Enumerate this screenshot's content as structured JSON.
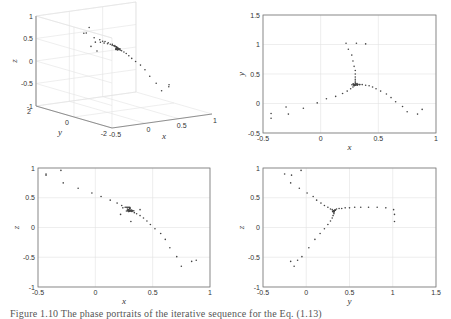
{
  "chart_data": [
    {
      "id": "view3d",
      "type": "scatter",
      "projection": "3d",
      "title": "",
      "xlabel": "x",
      "ylabel": "y",
      "zlabel": "z",
      "xlim": [
        -0.5,
        1
      ],
      "ylim": [
        -2,
        2
      ],
      "zlim": [
        -1,
        1
      ],
      "xticks": [
        "-0.5",
        "0",
        "0.5",
        "1"
      ],
      "yticks": [
        "-2",
        "0",
        "2"
      ],
      "zticks": [
        "-1",
        "-0.5",
        "0",
        "0.5",
        "1"
      ],
      "grid": true,
      "points_ref": "points"
    },
    {
      "id": "xy",
      "type": "scatter",
      "title": "",
      "xlabel": "x",
      "ylabel": "y",
      "xlim": [
        -0.5,
        1
      ],
      "ylim": [
        -0.5,
        1.5
      ],
      "xticks": [
        "-0.5",
        "0",
        "0.5",
        "1"
      ],
      "yticks": [
        "-0.5",
        "0",
        "0.5",
        "1",
        "1.5"
      ],
      "grid": true,
      "axes": [
        "x",
        "y"
      ]
    },
    {
      "id": "xz",
      "type": "scatter",
      "title": "",
      "xlabel": "x",
      "ylabel": "z",
      "xlim": [
        -0.5,
        1
      ],
      "ylim": [
        -1,
        1
      ],
      "xticks": [
        "-0.5",
        "0",
        "0.5",
        "1"
      ],
      "yticks": [
        "-1",
        "-0.5",
        "0",
        "0.5",
        "1"
      ],
      "grid": true,
      "axes": [
        "x",
        "z"
      ]
    },
    {
      "id": "yz",
      "type": "scatter",
      "title": "",
      "xlabel": "y",
      "ylabel": "z",
      "xlim": [
        -0.5,
        1.5
      ],
      "ylim": [
        -1,
        1
      ],
      "xticks": [
        "-0.5",
        "0",
        "0.5",
        "1",
        "1.5"
      ],
      "yticks": [
        "-1",
        "-0.5",
        "0",
        "0.5",
        "1"
      ],
      "grid": true,
      "axes": [
        "y",
        "z"
      ]
    }
  ],
  "points": {
    "fixed_point": [
      0.3,
      0.32,
      0.28
    ],
    "arm_a": [
      [
        -0.43,
        -0.25,
        0.9
      ],
      [
        -0.43,
        -0.17,
        0.88
      ],
      [
        -0.3,
        -0.06,
        0.96
      ],
      [
        -0.28,
        -0.18,
        0.75
      ],
      [
        -0.15,
        -0.08,
        0.66
      ],
      [
        -0.03,
        0.01,
        0.58
      ],
      [
        0.05,
        0.08,
        0.52
      ],
      [
        0.13,
        0.12,
        0.46
      ],
      [
        0.19,
        0.17,
        0.41
      ],
      [
        0.23,
        0.21,
        0.37
      ],
      [
        0.26,
        0.25,
        0.34
      ],
      [
        0.28,
        0.28,
        0.31
      ],
      [
        0.29,
        0.3,
        0.3
      ]
    ],
    "arm_b": [
      [
        0.22,
        1.02,
        0.22
      ],
      [
        0.31,
        1.02,
        0.1
      ],
      [
        0.39,
        1.01,
        0.3
      ],
      [
        0.24,
        0.92,
        0.33
      ],
      [
        0.27,
        0.82,
        0.34
      ],
      [
        0.28,
        0.72,
        0.34
      ],
      [
        0.29,
        0.63,
        0.34
      ],
      [
        0.3,
        0.56,
        0.34
      ],
      [
        0.3,
        0.5,
        0.33
      ],
      [
        0.3,
        0.45,
        0.33
      ],
      [
        0.3,
        0.41,
        0.32
      ],
      [
        0.3,
        0.38,
        0.32
      ],
      [
        0.3,
        0.35,
        0.31
      ]
    ],
    "arm_c": [
      [
        0.88,
        -0.1,
        -0.55
      ],
      [
        0.84,
        -0.18,
        -0.57
      ],
      [
        0.75,
        -0.14,
        -0.65
      ],
      [
        0.71,
        -0.05,
        -0.49
      ],
      [
        0.65,
        0.03,
        -0.34
      ],
      [
        0.61,
        0.1,
        -0.2
      ],
      [
        0.57,
        0.16,
        -0.1
      ],
      [
        0.52,
        0.21,
        -0.02
      ],
      [
        0.48,
        0.25,
        0.05
      ],
      [
        0.45,
        0.28,
        0.11
      ],
      [
        0.42,
        0.3,
        0.16
      ],
      [
        0.39,
        0.31,
        0.2
      ],
      [
        0.36,
        0.32,
        0.23
      ],
      [
        0.34,
        0.32,
        0.25
      ],
      [
        0.32,
        0.32,
        0.27
      ]
    ]
  },
  "caption": "Figure 1.10  The phase portraits of the iterative sequence for the Eq. (1.13)"
}
